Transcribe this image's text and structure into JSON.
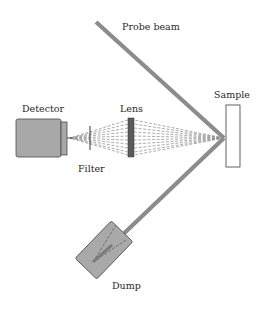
{
  "diagram": {
    "title": "",
    "labels": {
      "probe_beam": "Probe beam",
      "detector": "Detector",
      "lens": "Lens",
      "sample": "Sample",
      "filter": "Filter",
      "dump": "Dump"
    },
    "components": [
      {
        "id": "probe-beam",
        "type": "beam",
        "label": "Probe beam"
      },
      {
        "id": "sample",
        "type": "target",
        "label": "Sample"
      },
      {
        "id": "lens",
        "type": "lens",
        "label": "Lens"
      },
      {
        "id": "filter",
        "type": "filter",
        "label": "Filter"
      },
      {
        "id": "detector",
        "type": "detector",
        "label": "Detector"
      },
      {
        "id": "dump",
        "type": "beam-dump",
        "label": "Dump"
      }
    ],
    "connections": [
      {
        "from": "probe-beam",
        "to": "sample",
        "style": "solid-thick"
      },
      {
        "from": "sample",
        "to": "dump",
        "style": "solid-thick",
        "note": "reflected beam"
      },
      {
        "from": "sample",
        "to": "lens",
        "style": "dashed-fan",
        "note": "scattered light"
      },
      {
        "from": "lens",
        "to": "filter",
        "style": "dashed-fan"
      },
      {
        "from": "filter",
        "to": "detector",
        "style": "dashed-fan"
      }
    ],
    "colors": {
      "beam": "#8c8c8c",
      "detector_fill": "#a8a8a8",
      "detector_stroke": "#4a4a4a",
      "lens_fill": "#5a5a5a",
      "dump_fill": "#a9a9a9",
      "sample_fill": "#ffffff",
      "dash": "#7a7a7a",
      "text": "#2a2a2a"
    }
  }
}
